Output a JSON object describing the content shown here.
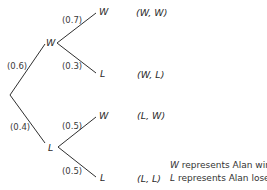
{
  "diagram": {
    "type": "probability-tree",
    "root": {
      "branches": [
        {
          "label": "W",
          "probability": "(0.6)",
          "branches": [
            {
              "label": "W",
              "probability": "(0.7)",
              "outcome": "(W, W)"
            },
            {
              "label": "L",
              "probability": "(0.3)",
              "outcome": "(W, L)"
            }
          ]
        },
        {
          "label": "L",
          "probability": "(0.4)",
          "branches": [
            {
              "label": "W",
              "probability": "(0.5)",
              "outcome": "(L, W)"
            },
            {
              "label": "L",
              "probability": "(0.5)",
              "outcome": "(L, L)"
            }
          ]
        }
      ]
    },
    "legend": [
      {
        "symbol": "W",
        "text": " represents Alan wins"
      },
      {
        "symbol": "L",
        "text": " represents Alan loses"
      }
    ],
    "line_color": "#2f2f2f",
    "text_color": "#2b2b2b"
  }
}
